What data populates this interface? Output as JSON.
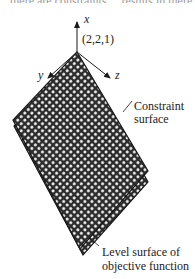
{
  "diagram": {
    "top_text_fragment": "there are constraints ... results in there",
    "axes": {
      "x": "x",
      "y": "y",
      "z": "z"
    },
    "point_label": "(2,2,1)",
    "labels": {
      "constraint_line1": "Constraint",
      "constraint_line2": "surface",
      "level_line1": "Level surface of",
      "level_line2": "objective function"
    },
    "colors": {
      "ink": "#1a1a1a",
      "surface_fill": "#2b2b2b",
      "background": "#ffffff"
    }
  }
}
